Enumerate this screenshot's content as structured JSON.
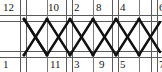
{
  "diagram": {
    "type": "truss-lattice-diagram",
    "width": 162,
    "height": 72,
    "colors": {
      "member": "#111111",
      "chord": "#4a4a4a",
      "background": "#ffffff",
      "label": "#151515"
    },
    "geometry": {
      "top_chord_y": 19,
      "bottom_chord_y": 55,
      "chord_line_gap": 4,
      "panel_x": [
        24,
        70,
        116,
        155
      ],
      "mid_x": [
        47,
        93,
        139
      ],
      "vertical_pairs": [
        [
          20,
          26
        ],
        [
          66,
          72
        ],
        [
          112,
          118
        ],
        [
          151,
          157
        ]
      ]
    },
    "top_labels": [
      {
        "text": "12",
        "x": 3,
        "node": "joint-12"
      },
      {
        "text": "10",
        "x": 48,
        "node": "joint-10"
      },
      {
        "text": "2",
        "x": 72,
        "node": "joint-2"
      },
      {
        "text": "8",
        "x": 96,
        "node": "joint-8"
      },
      {
        "text": "4",
        "x": 120,
        "node": "joint-4"
      },
      {
        "text": "6",
        "x": 158,
        "node": "joint-6"
      }
    ],
    "bottom_labels": [
      {
        "text": "1",
        "x": 3,
        "node": "joint-1"
      },
      {
        "text": "11",
        "x": 50,
        "node": "joint-11"
      },
      {
        "text": "3",
        "x": 73,
        "node": "joint-3"
      },
      {
        "text": "9",
        "x": 98,
        "node": "joint-9"
      },
      {
        "text": "5",
        "x": 120,
        "node": "joint-5"
      },
      {
        "text": "7",
        "x": 158,
        "node": "joint-7"
      }
    ]
  }
}
